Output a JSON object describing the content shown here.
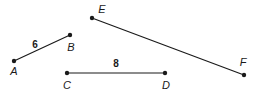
{
  "figure": {
    "background_color": "#ffffff",
    "stroke_color": "#1a1a1a",
    "stroke_width": 1.2,
    "point_radius": 2.2,
    "width": 258,
    "height": 99
  },
  "points": [
    {
      "id": "A",
      "label": "A",
      "x": 14,
      "y": 61,
      "label_x": 14,
      "label_y": 71
    },
    {
      "id": "B",
      "label": "B",
      "x": 70,
      "y": 35,
      "label_x": 71,
      "label_y": 47
    },
    {
      "id": "C",
      "label": "C",
      "x": 67,
      "y": 73,
      "label_x": 67,
      "label_y": 85
    },
    {
      "id": "D",
      "label": "D",
      "x": 165,
      "y": 73,
      "label_x": 166,
      "label_y": 85
    },
    {
      "id": "E",
      "label": "E",
      "x": 92,
      "y": 18,
      "label_x": 102,
      "label_y": 9
    },
    {
      "id": "F",
      "label": "F",
      "x": 244,
      "y": 75,
      "label_x": 243,
      "label_y": 62
    }
  ],
  "segments": [
    {
      "id": "AB",
      "from": "A",
      "to": "B",
      "x1": 14,
      "y1": 61,
      "x2": 70,
      "y2": 35,
      "length_label": "6",
      "label_x": 35,
      "label_y": 45
    },
    {
      "id": "CD",
      "from": "C",
      "to": "D",
      "x1": 67,
      "y1": 73,
      "x2": 165,
      "y2": 73,
      "length_label": "8",
      "label_x": 116,
      "label_y": 64
    },
    {
      "id": "EF",
      "from": "E",
      "to": "F",
      "x1": 92,
      "y1": 18,
      "x2": 244,
      "y2": 75,
      "length_label": "",
      "label_x": 0,
      "label_y": 0
    }
  ],
  "measurements": [
    {
      "segment": "AB",
      "value": "6"
    },
    {
      "segment": "CD",
      "value": "8"
    }
  ]
}
